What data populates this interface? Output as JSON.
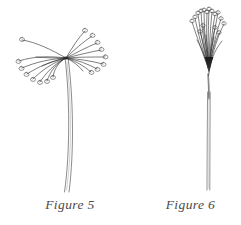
{
  "plate": {
    "kind": "botanical-line-drawing-plate",
    "background_color": "#ffffff",
    "ink_color": "#2e2e2e",
    "caption_color": "#4a4a4a",
    "width": 241,
    "height": 225
  },
  "figures": [
    {
      "id": "figure-5",
      "caption": "Figure 5",
      "subject": "umbel seed head with spreading rays",
      "description": "Open, widely spreading umbel: many slender rays radiate outward and droop from a single central node, each ray tipped with a small oval bud; a long slightly curving double-line stalk descends below.",
      "node": {
        "x": 66,
        "y": 58
      },
      "ray_count": 19,
      "stem": {
        "top_x": 68,
        "bottom_x": 67,
        "bottom_y": 192,
        "style": "double-line, gently curved"
      },
      "tip_shape": "small open loop bud"
    },
    {
      "id": "figure-6",
      "caption": "Figure 6",
      "subject": "umbel seed head with closed, upright rays",
      "description": "Closed, upright umbel: rays converge tightly into a dark narrow node and rise almost vertically in a compact bundle, each tipped with a small bud; a long straight fine stalk descends below.",
      "node": {
        "x": 209,
        "y": 70
      },
      "ray_count": 20,
      "stem": {
        "top_x": 209,
        "bottom_x": 208,
        "bottom_y": 190,
        "style": "double-line, straight"
      },
      "tip_shape": "small open loop bud"
    }
  ],
  "captions": {
    "figure_5": "Figure 5",
    "figure_6": "Figure 6"
  }
}
